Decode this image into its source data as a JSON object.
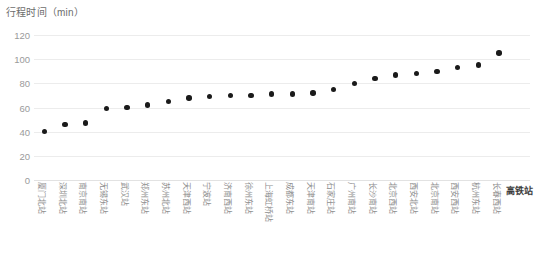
{
  "chart_data": {
    "type": "scatter",
    "title": "行程时间（min）",
    "xlabel": "高铁站",
    "ylabel": "",
    "ylim": [
      0,
      120
    ],
    "yticks": [
      "0",
      "20",
      "40",
      "60",
      "80",
      "100",
      "120"
    ],
    "grid": true,
    "legend": null,
    "series_color": "#1a1a1a",
    "categories": [
      "厦门北站",
      "深圳北站",
      "南京南站",
      "无锡东站",
      "武汉站",
      "郑州东站",
      "苏州北站",
      "天津西站",
      "宁波站",
      "济南西站",
      "徐州东站",
      "上海虹桥站",
      "成都东站",
      "天津南站",
      "石家庄站",
      "广州南站",
      "长沙南站",
      "北京西站",
      "西安北站",
      "北京南站",
      "西安西站",
      "杭州东站",
      "长春西站",
      "高铁站"
    ],
    "values": [
      40,
      46,
      47,
      59,
      60,
      62,
      65,
      68,
      69,
      70,
      70,
      71,
      71,
      72,
      75,
      80,
      84,
      87,
      88,
      90,
      93,
      95,
      105,
      112
    ]
  }
}
